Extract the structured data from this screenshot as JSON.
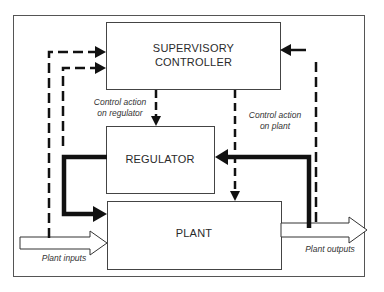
{
  "diagram": {
    "type": "block-diagram",
    "blocks": {
      "supervisory_controller": {
        "line1": "SUPERVISORY",
        "line2": "CONTROLLER"
      },
      "regulator": {
        "label": "REGULATOR"
      },
      "plant": {
        "label": "PLANT"
      }
    },
    "labels": {
      "control_regulator_1": "Control action",
      "control_regulator_2": "on regulator",
      "control_plant_1": "Control action",
      "control_plant_2": "on plant",
      "plant_inputs": "Plant inputs",
      "plant_outputs": "Plant outputs"
    },
    "connections": [
      {
        "from": "Plant inputs",
        "to": "Supervisory Controller",
        "style": "dashed"
      },
      {
        "from": "Regulator output",
        "to": "Supervisory Controller",
        "style": "dashed"
      },
      {
        "from": "Plant outputs",
        "to": "Supervisory Controller",
        "style": "dashed"
      },
      {
        "from": "Supervisory Controller",
        "to": "Regulator",
        "style": "dashed",
        "label": "Control action on regulator"
      },
      {
        "from": "Supervisory Controller",
        "to": "Plant",
        "style": "dashed",
        "label": "Control action on plant"
      },
      {
        "from": "Regulator",
        "to": "Plant",
        "style": "thick"
      },
      {
        "from": "Plant outputs",
        "to": "Regulator",
        "style": "thick"
      },
      {
        "from": "Plant inputs",
        "to": "Plant",
        "style": "hollow-arrow"
      },
      {
        "from": "Plant",
        "to": "Plant outputs",
        "style": "hollow-arrow"
      }
    ],
    "colors": {
      "line": "#111111",
      "frame": "#555555",
      "background": "#ffffff"
    }
  }
}
